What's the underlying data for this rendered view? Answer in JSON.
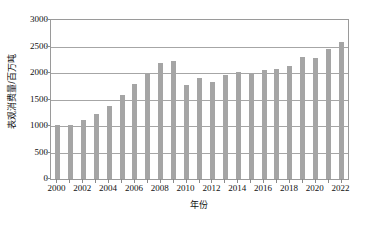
{
  "chart_data": {
    "type": "bar",
    "title": "",
    "xlabel": "年份",
    "ylabel": "表观消费量/百万吨",
    "categories": [
      "2000",
      "2001",
      "2002",
      "2003",
      "2004",
      "2005",
      "2006",
      "2007",
      "2008",
      "2009",
      "2010",
      "2011",
      "2012",
      "2013",
      "2014",
      "2015",
      "2016",
      "2017",
      "2018",
      "2019",
      "2020",
      "2021",
      "2022"
    ],
    "values": [
      1020,
      1020,
      1120,
      1220,
      1380,
      1580,
      1790,
      1990,
      2180,
      2230,
      1770,
      1910,
      1830,
      1970,
      2020,
      1995,
      2050,
      2085,
      2140,
      2300,
      2290,
      2460,
      2590
    ],
    "ylim": [
      0,
      3000
    ],
    "yticks": [
      0,
      500,
      1000,
      1500,
      2000,
      2500,
      3000
    ],
    "ytick_labels": [
      "0",
      "500",
      "1000",
      "1500",
      "2000",
      "2500",
      "3000"
    ],
    "xtick_labels": [
      "2000",
      "2002",
      "2004",
      "2006",
      "2008",
      "2010",
      "2012",
      "2014",
      "2016",
      "2018",
      "2020",
      "2022"
    ],
    "grid": "horizontal",
    "legend": "none",
    "bar_color": "#a5a5a5",
    "axis_color": "#9a9a9a",
    "gridline_color": "#a6a6a6",
    "background_color": "#ffffff"
  }
}
